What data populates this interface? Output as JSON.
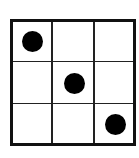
{
  "diagram": {
    "type": "grid",
    "rows": 3,
    "cols": 3,
    "border_color": "#111111",
    "line_color": "#222222",
    "dot_color": "#000000",
    "background": "#ffffff",
    "dots": [
      {
        "row": 0,
        "col": 0
      },
      {
        "row": 1,
        "col": 1
      },
      {
        "row": 2,
        "col": 2
      }
    ]
  }
}
